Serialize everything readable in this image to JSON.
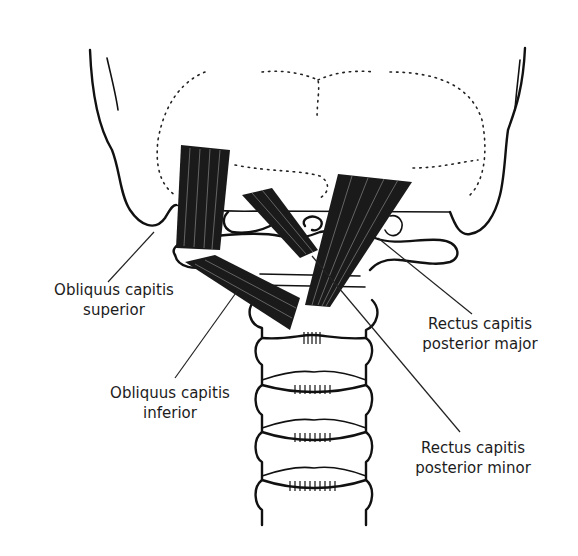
{
  "figure": {
    "colors": {
      "ink": "#111111",
      "background": "#ffffff",
      "label_text": "#1c1c1c"
    },
    "labels": [
      {
        "id": "obliquus-capitis-superior",
        "line1": "Obliquus capitis",
        "line2": "superior"
      },
      {
        "id": "obliquus-capitis-inferior",
        "line1": "Obliquus capitis",
        "line2": "inferior"
      },
      {
        "id": "rectus-capitis-posterior-major",
        "line1": "Rectus capitis",
        "line2": "posterior major"
      },
      {
        "id": "rectus-capitis-posterior-minor",
        "line1": "Rectus capitis",
        "line2": "posterior minor"
      }
    ]
  }
}
